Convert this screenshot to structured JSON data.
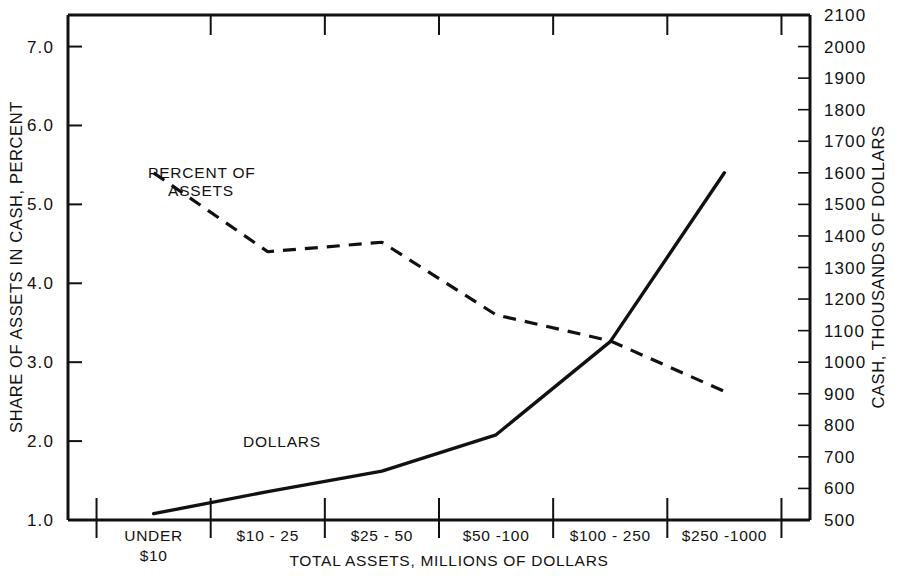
{
  "chart_data": {
    "type": "line",
    "title": "",
    "subtitle": "",
    "xlabel": "TOTAL ASSETS, MILLIONS OF DOLLARS",
    "ylabel": "SHARE OF ASSETS IN CASH, PERCENT",
    "y2label": "CASH, THOUSANDS OF DOLLARS",
    "categories": [
      "UNDER $10",
      "$10 - 25",
      "$25 - 50",
      "$50 -100",
      "$100 - 250",
      "$250 -1000"
    ],
    "category_lines": [
      [
        "UNDER",
        "$10"
      ],
      [
        "$10 - 25",
        ""
      ],
      [
        "$25 - 50",
        ""
      ],
      [
        "$50 -100",
        ""
      ],
      [
        "$100 - 250",
        ""
      ],
      [
        "$250 -1000",
        ""
      ]
    ],
    "ylim": [
      1.0,
      7.4
    ],
    "y2lim": [
      500,
      2100
    ],
    "yticks": [
      "7.0",
      "6.0",
      "5.0",
      "4.0",
      "3.0",
      "2.0",
      "1.0"
    ],
    "ytick_values": [
      7.0,
      6.0,
      5.0,
      4.0,
      3.0,
      2.0,
      1.0
    ],
    "y2ticks": [
      "2100",
      "2000",
      "1900",
      "1800",
      "1700",
      "1600",
      "1500",
      "1400",
      "1300",
      "1200",
      "1100",
      "1000",
      "900",
      "800",
      "700",
      "600",
      "500"
    ],
    "y2tick_values": [
      2100,
      2000,
      1900,
      1800,
      1700,
      1600,
      1500,
      1400,
      1300,
      1200,
      1100,
      1000,
      900,
      800,
      700,
      600,
      500
    ],
    "grid": false,
    "legend_position": "inline-annotation",
    "series": [
      {
        "name": "PERCENT OF ASSETS",
        "axis": "left",
        "style": "dashed",
        "label_lines": [
          "PERCENT OF",
          "ASSETS"
        ],
        "values": [
          5.4,
          4.4,
          4.52,
          3.6,
          3.27,
          2.63
        ]
      },
      {
        "name": "DOLLARS",
        "axis": "right",
        "style": "solid",
        "label_lines": [
          "DOLLARS"
        ],
        "values": [
          520,
          590,
          655,
          770,
          1065,
          1600
        ]
      }
    ],
    "annotations": [
      {
        "name": "percent-of-assets-label",
        "text": "PERCENT OF ASSETS"
      },
      {
        "name": "dollars-label",
        "text": "DOLLARS"
      }
    ],
    "colors": {
      "line": "#111111",
      "axis": "#111111",
      "background": "#ffffff"
    }
  }
}
